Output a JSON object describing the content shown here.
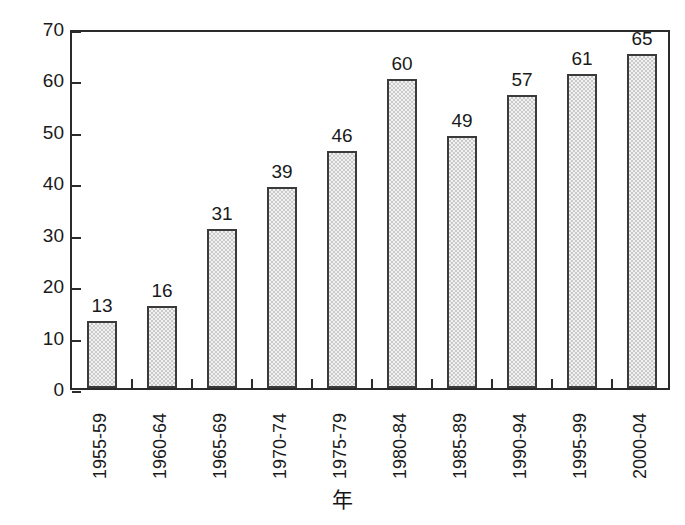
{
  "chart_data": {
    "type": "bar",
    "title": "",
    "xlabel": "年",
    "ylabel": "掲載論文数（編/年）",
    "categories": [
      "1955-59",
      "1960-64",
      "1965-69",
      "1970-74",
      "1975-79",
      "1980-84",
      "1985-89",
      "1990-94",
      "1995-99",
      "2000-04"
    ],
    "values": [
      13,
      16,
      31,
      39,
      46,
      60,
      49,
      57,
      61,
      65
    ],
    "value_labels": [
      "13",
      "16",
      "31",
      "39",
      "46",
      "60",
      "49",
      "57",
      "61",
      "65"
    ],
    "ylim": [
      0,
      70
    ],
    "ytick_values": [
      0,
      10,
      20,
      30,
      40,
      50,
      60,
      70
    ],
    "ytick_labels": [
      "0",
      "10",
      "20",
      "30",
      "40",
      "50",
      "60",
      "70"
    ],
    "grid": false,
    "legend": false,
    "legend_position": "none",
    "bar_fill": "#f2f2f2",
    "bar_pattern": "dotted-stipple",
    "bar_edge_color": "#3a3a3a",
    "axis_color": "#2b2b2b",
    "text_color": "#1a1a1a",
    "background": "#ffffff",
    "xtick_direction": "out",
    "ytick_direction": "in",
    "xlabel_rotation": 90,
    "ylabel_rotation": 90
  }
}
